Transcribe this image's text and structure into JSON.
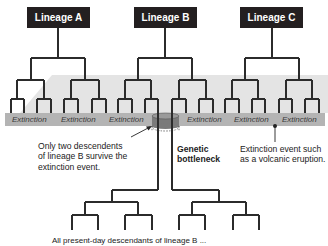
{
  "lineages": [
    {
      "label": "Lineage A"
    },
    {
      "label": "Lineage B"
    },
    {
      "label": "Lineage C"
    }
  ],
  "extinction_labels": [
    "Extinction",
    "Extinction",
    "Extinction",
    "Extinction",
    "Extinction",
    "Extinction"
  ],
  "annotations": {
    "survivors_note": "Only two descendents of lineage B survive the extinction event.",
    "survivors_lines": [
      "Only two descendents",
      "of lineage B survive the",
      "extinction event."
    ],
    "bottleneck_lines": [
      "Genetic",
      "bottleneck"
    ],
    "event_lines": [
      "Extinction event such",
      "as a volcanic eruption."
    ],
    "bottom_caption": "All present-day descendants of lineage B ..."
  },
  "colors": {
    "box_fill": "#231f20",
    "tree_line": "#2b2b2b",
    "band_fill": "#b4b4b4",
    "platform_fill": "#e2e2e2"
  }
}
